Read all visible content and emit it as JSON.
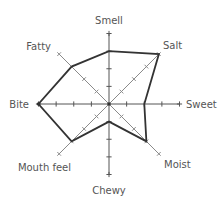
{
  "chart_data": {
    "type": "radar",
    "title": "",
    "categories": [
      "Smell",
      "Salt",
      "Sweet",
      "Moist",
      "Chewy",
      "Mouth feel",
      "Bite",
      "Fatty"
    ],
    "series": [
      {
        "name": "Profile",
        "values": [
          3,
          4,
          2,
          3,
          1,
          3,
          4,
          3
        ]
      }
    ],
    "rlim": [
      0,
      4
    ],
    "ticks": [
      1,
      2,
      3,
      4
    ],
    "grid": false,
    "legend": null
  },
  "labels": {
    "smell": "Smell",
    "salt": "Salt",
    "sweet": "Sweet",
    "moist": "Moist",
    "chewy": "Chewy",
    "mouth_feel": "Mouth feel",
    "bite": "Bite",
    "fatty": "Fatty"
  },
  "colors": {
    "polygon": "#333333",
    "main_axes": "#555555",
    "diagonal_axes": "#8a8a8a",
    "label": "#555555"
  }
}
